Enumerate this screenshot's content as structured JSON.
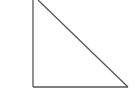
{
  "diagram": {
    "shape": "right-triangle",
    "stroke_color": "#555555",
    "fill_color": "#ffffff",
    "background": "#ffffff",
    "vertices": [
      [
        33,
        0
      ],
      [
        33,
        87
      ],
      [
        128,
        87
      ]
    ],
    "hypotenuse_top": [
      38,
      0
    ]
  }
}
